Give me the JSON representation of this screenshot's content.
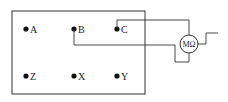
{
  "diagram": {
    "type": "circuit",
    "panel": {
      "label": ""
    },
    "terminals": [
      {
        "id": "A",
        "label": "A",
        "x": 26,
        "y": 29
      },
      {
        "id": "B",
        "label": "B",
        "x": 74,
        "y": 29
      },
      {
        "id": "C",
        "label": "C",
        "x": 117,
        "y": 29
      },
      {
        "id": "Z",
        "label": "Z",
        "x": 26,
        "y": 76
      },
      {
        "id": "X",
        "label": "X",
        "x": 74,
        "y": 76
      },
      {
        "id": "Y",
        "label": "Y",
        "x": 117,
        "y": 76
      }
    ],
    "meter": {
      "label": "MΩ",
      "name": "megohmmeter"
    },
    "connections": [
      {
        "from": "C",
        "to": "meter-top"
      },
      {
        "from": "B",
        "to": "meter-bottom"
      },
      {
        "from": "meter-right",
        "to": "external-lead"
      }
    ]
  }
}
